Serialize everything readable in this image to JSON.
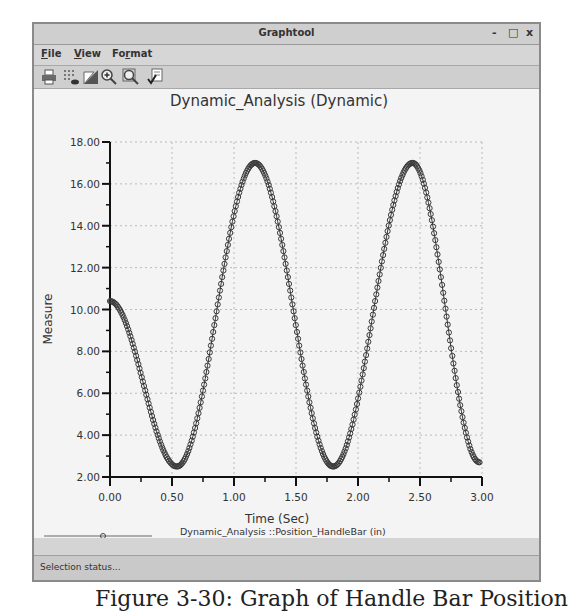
{
  "window": {
    "title": "Graphtool",
    "controls": {
      "minimize": "-",
      "maximize": "□",
      "close": "x"
    }
  },
  "menu": {
    "items": [
      {
        "label": "File",
        "mnemonic": "F",
        "rest": "ile"
      },
      {
        "label": "View",
        "mnemonic": "V",
        "rest": "iew"
      },
      {
        "label": "Format",
        "mnemonic": "r",
        "pre": "Fo",
        "rest": "mat"
      }
    ]
  },
  "toolbar": {
    "icons": [
      "print-icon",
      "grid-toggle-icon",
      "background-icon",
      "zoom-in-icon",
      "zoom-fit-icon",
      "format-check-icon"
    ]
  },
  "status": {
    "text": "Selection status..."
  },
  "caption": {
    "text": "Figure 3-30: Graph of Handle Bar Position"
  },
  "chart_data": {
    "type": "line",
    "title": "Dynamic_Analysis  (Dynamic)",
    "xlabel": "Time (Sec)",
    "ylabel": "Measure",
    "xlim": [
      0,
      3
    ],
    "ylim": [
      2,
      18
    ],
    "x_ticks": [
      "0.00",
      "0.50",
      "1.00",
      "1.50",
      "2.00",
      "2.50",
      "3.00"
    ],
    "y_ticks": [
      "2.00",
      "4.00",
      "6.00",
      "8.00",
      "10.00",
      "12.00",
      "14.00",
      "16.00",
      "18.00"
    ],
    "grid": true,
    "legend_position": "bottom",
    "markers": "circle",
    "series": [
      {
        "name": "Dynamic_Analysis ::Position_HandleBar (in)",
        "key_points": [
          {
            "x": 0.0,
            "y": 10.4
          },
          {
            "x": 0.54,
            "y": 2.5
          },
          {
            "x": 1.17,
            "y": 17.0
          },
          {
            "x": 1.8,
            "y": 2.5
          },
          {
            "x": 2.44,
            "y": 17.0
          },
          {
            "x": 2.98,
            "y": 2.7
          }
        ]
      }
    ]
  }
}
